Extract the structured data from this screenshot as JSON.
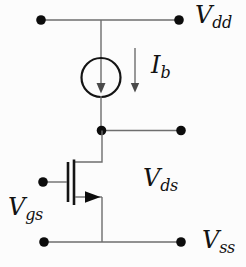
{
  "diagram": {
    "labels": {
      "vdd": {
        "base": "V",
        "sub": "dd"
      },
      "ib": {
        "base": "I",
        "sub": "b"
      },
      "vds": {
        "base": "V",
        "sub": "ds"
      },
      "vgs": {
        "base": "V",
        "sub": "gs"
      },
      "vss": {
        "base": "V",
        "sub": "ss"
      }
    },
    "colors": {
      "background": "#fcfcfc",
      "wire": "#6e6e6e",
      "component_stroke": "#141414",
      "node_fill": "#0c0c0c",
      "text": "#121212"
    }
  }
}
